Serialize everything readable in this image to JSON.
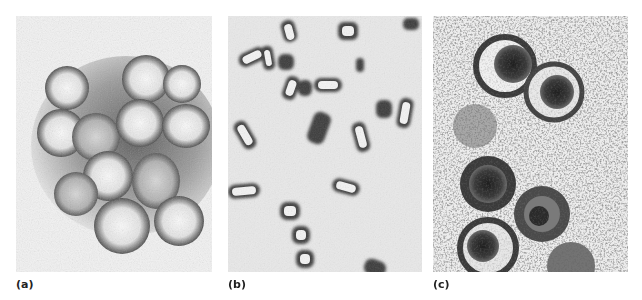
{
  "figure": {
    "panels": [
      {
        "id": "a",
        "label": "(a)",
        "subject": "spherical enveloped virus particles with spiky surface (electron micrograph)"
      },
      {
        "id": "b",
        "label": "(b)",
        "subject": "bullet/rod-shaped virus particles (electron micrograph)"
      },
      {
        "id": "c",
        "label": "(c)",
        "subject": "round virions with dark cores and outer envelopes in thin section (electron micrograph)"
      }
    ]
  }
}
